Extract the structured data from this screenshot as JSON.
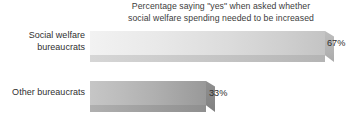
{
  "chart_data": {
    "type": "bar",
    "orientation": "horizontal",
    "title": "Percentage saying \"yes\" when asked whether\nsocial welfare spending needed to be increased",
    "xlabel": "",
    "ylabel": "",
    "categories": [
      "Social welfare\nbureaucrats",
      "Other bureaucrats"
    ],
    "values": [
      67,
      33
    ],
    "value_labels": [
      "67%",
      "33%"
    ],
    "xlim": [
      0,
      100
    ],
    "grid": false,
    "legend": false,
    "series": [
      {
        "name": "Percentage saying yes",
        "values": [
          67,
          33
        ]
      }
    ],
    "bar_colors": [
      "#dcdcdc",
      "#b0b0b0"
    ],
    "text_color": "#2f2f2f",
    "background_color": "#ffffff"
  },
  "bars": [
    {
      "category": "Social welfare\nbureaucrats",
      "value_label": "67%",
      "width_px": 235
    },
    {
      "category": "Other bureaucrats",
      "value_label": "33%",
      "width_px": 116
    }
  ]
}
